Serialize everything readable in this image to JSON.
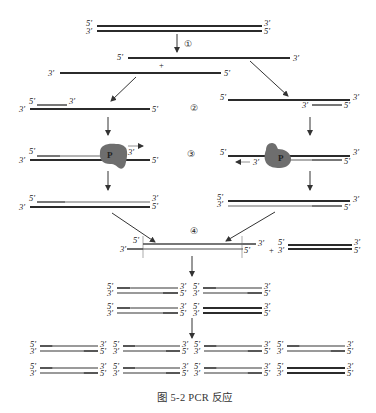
{
  "figure": {
    "caption": "图 5-2   PCR 反应"
  },
  "labels": {
    "five_prime": "5′",
    "three_prime": "3′",
    "plus": "+",
    "polymerase": "P"
  },
  "steps": [
    {
      "id": 1,
      "symbol": "①",
      "meaning": "denaturation"
    },
    {
      "id": 2,
      "symbol": "②",
      "meaning": "annealing"
    },
    {
      "id": 3,
      "symbol": "③",
      "meaning": "extension"
    },
    {
      "id": 4,
      "symbol": "④",
      "meaning": "next cycle"
    }
  ],
  "colors": {
    "strand_dark": "#2b2b2b",
    "strand_light": "#8a8a8a",
    "polymerase": "#6e6e6e",
    "arrow": "#333333",
    "text": "#222222"
  },
  "copies": {
    "after_cycle_2": 4,
    "after_cycle_3": 8
  }
}
